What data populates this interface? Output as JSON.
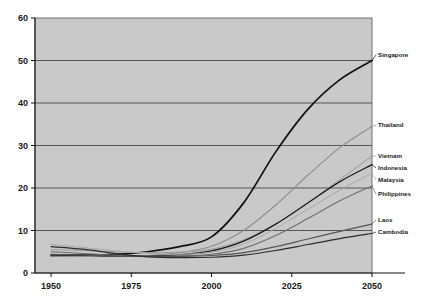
{
  "chart_data": {
    "type": "line",
    "title": "",
    "subtitle": "",
    "xlabel": "",
    "ylabel": "",
    "xlim": [
      1945,
      2050
    ],
    "ylim": [
      0,
      60
    ],
    "xticks": [
      1950,
      1975,
      2000,
      2025,
      2050
    ],
    "yticks": [
      0,
      10,
      20,
      30,
      40,
      50,
      60
    ],
    "grid": true,
    "grid_axis": "y",
    "legend_position": "right-inline-labels",
    "plot_background": "#c9c9c9",
    "x": [
      1950,
      1960,
      1970,
      1980,
      1990,
      2000,
      2010,
      2020,
      2030,
      2040,
      2050
    ],
    "series": [
      {
        "name": "Singapore",
        "color": "#111111",
        "width": 1.7,
        "label_value": 50,
        "values": [
          4.1,
          4.2,
          4.4,
          5.0,
          6.2,
          8.5,
          16.5,
          28.5,
          38.5,
          45.5,
          50.0
        ]
      },
      {
        "name": "Thailand",
        "color": "#8c8c8c",
        "width": 1.1,
        "label_value": 34.5,
        "values": [
          4.0,
          3.9,
          3.9,
          4.1,
          4.8,
          6.3,
          10.0,
          16.0,
          23.0,
          29.5,
          34.5
        ]
      },
      {
        "name": "Vietnam",
        "color": "#9a9a9a",
        "width": 1.0,
        "label_value": 27.5,
        "values": [
          5.5,
          5.3,
          5.0,
          4.8,
          4.9,
          5.6,
          7.8,
          11.5,
          16.5,
          22.0,
          27.5
        ]
      },
      {
        "name": "Indonesia",
        "color": "#1a1a1a",
        "width": 1.2,
        "label_value": 25.5,
        "values": [
          4.3,
          4.2,
          4.0,
          4.0,
          4.3,
          5.2,
          7.5,
          11.5,
          16.5,
          21.5,
          25.5
        ]
      },
      {
        "name": "Malaysia",
        "color": "#a8a8a8",
        "width": 1.0,
        "label_value": 23.5,
        "values": [
          6.7,
          6.0,
          5.2,
          4.6,
          4.4,
          4.9,
          6.8,
          10.5,
          15.0,
          19.5,
          23.5
        ]
      },
      {
        "name": "Philippines",
        "color": "#6e6e6e",
        "width": 1.1,
        "label_value": 20.5,
        "values": [
          5.0,
          4.6,
          4.2,
          4.0,
          4.0,
          4.4,
          5.8,
          8.8,
          12.8,
          17.0,
          20.5
        ]
      },
      {
        "name": "Laos",
        "color": "#555555",
        "width": 1.1,
        "label_value": 11.5,
        "values": [
          4.4,
          4.2,
          4.0,
          3.9,
          3.9,
          4.1,
          4.8,
          6.2,
          8.0,
          9.8,
          11.5
        ]
      },
      {
        "name": "Cambodia",
        "color": "#2b2b2b",
        "width": 1.2,
        "label_value": 9.3,
        "values": [
          6.2,
          5.6,
          4.6,
          3.8,
          3.6,
          3.7,
          4.2,
          5.3,
          6.7,
          8.1,
          9.3
        ]
      }
    ]
  },
  "axis": {
    "y_labels": [
      "60",
      "50",
      "40",
      "30",
      "20",
      "10",
      "0"
    ],
    "x_labels": [
      "1950",
      "1975",
      "2000",
      "2025",
      "2050"
    ]
  },
  "labels": {
    "singapore": "Singapore",
    "thailand": "Thailand",
    "vietnam": "Vietnam",
    "indonesia": "Indonesia",
    "malaysia": "Malaysia",
    "philippines": "Philippines",
    "laos": "Laos",
    "cambodia": "Cambodia"
  }
}
